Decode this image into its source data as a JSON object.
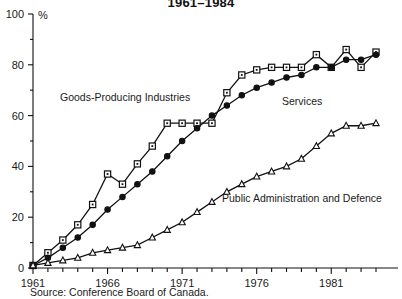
{
  "chart_data": {
    "type": "line",
    "title": "1961–1984",
    "xlabel": "",
    "ylabel": "%",
    "xlim": [
      1961,
      1984
    ],
    "ylim": [
      0,
      100
    ],
    "ytick_labels": [
      "0",
      "20",
      "40",
      "60",
      "80",
      "100"
    ],
    "yticks": [
      0,
      20,
      40,
      60,
      80,
      100
    ],
    "y_minor_ticks": [
      10,
      30,
      50,
      70,
      90
    ],
    "xtick_labels": [
      "1961",
      "1966",
      "1971",
      "1976",
      "1981"
    ],
    "xticks": [
      1961,
      1966,
      1971,
      1976,
      1981
    ],
    "grid": false,
    "legend_position": "inline-annotations",
    "x": [
      1961,
      1962,
      1963,
      1964,
      1965,
      1966,
      1967,
      1968,
      1969,
      1970,
      1971,
      1972,
      1973,
      1974,
      1975,
      1976,
      1977,
      1978,
      1979,
      1980,
      1981,
      1982,
      1983,
      1984
    ],
    "series": [
      {
        "name": "Goods-Producing Industries",
        "marker": "square",
        "values": [
          1,
          6,
          11,
          17,
          25,
          37,
          33,
          41,
          48,
          57,
          57,
          57,
          57,
          69,
          76,
          78,
          79,
          79,
          79,
          84,
          79,
          86,
          79,
          85
        ]
      },
      {
        "name": "Services",
        "marker": "filled-circle",
        "values": [
          1,
          4,
          8,
          12,
          17,
          23,
          28,
          33,
          38,
          44,
          50,
          55,
          60,
          64,
          68,
          71,
          73,
          75,
          76,
          79,
          79,
          82,
          82,
          84
        ]
      },
      {
        "name": "Public Administration and Defence",
        "marker": "triangle",
        "values": [
          1,
          2,
          3,
          4,
          6,
          7,
          8,
          9,
          12,
          15,
          18,
          22,
          26,
          30,
          33,
          36,
          38,
          40,
          43,
          48,
          53,
          56,
          56,
          57
        ]
      }
    ],
    "annotations": [
      {
        "text": "Goods-Producing Industries",
        "x_px": 60,
        "y_px": 101
      },
      {
        "text": "Services",
        "x_px": 282,
        "y_px": 105
      },
      {
        "text": "Public Administration and Defence",
        "x_px": 222,
        "y_px": 202
      }
    ],
    "source": "Source: Conference Board of Canada."
  },
  "colors": {
    "ink": "#111111",
    "background": "#ffffff",
    "marker_fill": "#ffffff"
  }
}
